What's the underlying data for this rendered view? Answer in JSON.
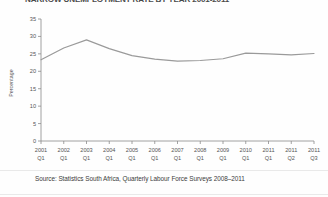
{
  "figure": {
    "title": "NARROW UNEMPLOYMENT RATE BY YEAR 2001-2011",
    "source": "Source: Statistics South Africa, Quarterly Labour Force Surveys 2008–2011",
    "line_color": "#9a9a9a",
    "axis_color": "#8c8c8c",
    "text_color": "#555555",
    "background": "#fefefe"
  },
  "chart_data": {
    "type": "line",
    "title": "NARROW UNEMPLOYMENT RATE BY YEAR 2001-2011",
    "xlabel": "",
    "ylabel": "Percentage",
    "ylim": [
      0,
      35
    ],
    "yticks": [
      0,
      5,
      10,
      15,
      20,
      25,
      30,
      35
    ],
    "ytick_labels": [
      "0",
      "5",
      "10",
      "15",
      "20",
      "25",
      "30",
      "35"
    ],
    "grid": false,
    "legend": "none",
    "categories": [
      "2001 Q1",
      "2002 Q1",
      "2003 Q1",
      "2004 Q1",
      "2005 Q1",
      "2006 Q1",
      "2007 Q1",
      "2008 Q1",
      "2009 Q1",
      "2010 Q1",
      "2011 Q1",
      "2011 Q2",
      "2011 Q3"
    ],
    "xtick_labels_line1": [
      "2001",
      "2002",
      "2003",
      "2004",
      "2005",
      "2006",
      "2007",
      "2008",
      "2009",
      "2010",
      "2011",
      "2011",
      "2011"
    ],
    "xtick_labels_line2": [
      "Q1",
      "Q1",
      "Q1",
      "Q1",
      "Q1",
      "Q1",
      "Q1",
      "Q1",
      "Q1",
      "Q1",
      "Q1",
      "Q2",
      "Q3"
    ],
    "series": [
      {
        "name": "Narrow unemployment rate",
        "values": [
          23.3,
          26.7,
          29.0,
          26.5,
          24.5,
          23.5,
          22.9,
          23.1,
          23.6,
          25.2,
          25.0,
          24.7,
          25.1
        ]
      }
    ]
  }
}
